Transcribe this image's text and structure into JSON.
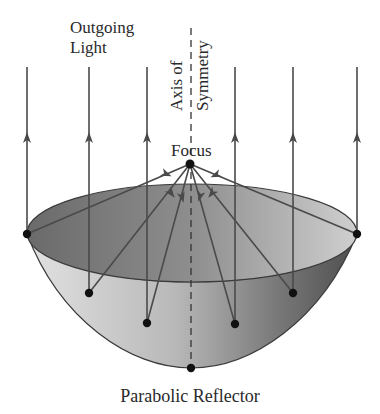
{
  "diagram": {
    "title": "Parabolic Reflector",
    "labels": {
      "outgoing_line1": "Outgoing",
      "outgoing_line2": "Light",
      "axis_line1": "Axis of",
      "axis_line2": "Symmetry",
      "focus": "Focus"
    },
    "colors": {
      "line": "#4a4a4a",
      "dot": "#111111",
      "rim_inner_dark": "#6e6e6e",
      "rim_inner_light": "#c4c4c4",
      "bowl_light": "#d6d6d6",
      "bowl_dark": "#5a5a5a"
    },
    "focus_point": [
      190,
      164
    ],
    "vertex_point": [
      191,
      368
    ],
    "reflection_points": [
      [
        27,
        234
      ],
      [
        89,
        293
      ],
      [
        147,
        323
      ],
      [
        235,
        324
      ],
      [
        293,
        293
      ],
      [
        357,
        234
      ]
    ],
    "ray_x_positions": [
      27,
      89,
      147,
      235,
      293,
      357
    ]
  }
}
